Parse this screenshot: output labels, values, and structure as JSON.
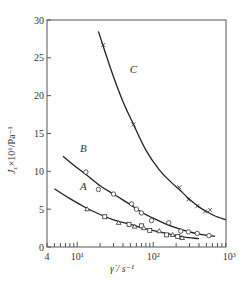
{
  "chart_data": {
    "type": "line",
    "title": "",
    "xlabel": "γ̇ / s⁻¹",
    "ylabel": "Jc × 10⁶ / Pa⁻¹",
    "xscale": "log",
    "xlim": [
      4,
      1000
    ],
    "ylim": [
      0,
      30
    ],
    "x_ticks": [
      {
        "value": 4,
        "label": "4"
      },
      {
        "value": 10,
        "label": "10¹"
      },
      {
        "value": 100,
        "label": "10²"
      },
      {
        "value": 1000,
        "label": "10³"
      }
    ],
    "y_ticks": [
      0,
      5,
      10,
      15,
      20,
      25,
      30
    ],
    "grid": false,
    "legend": null,
    "series": [
      {
        "name": "C",
        "marker": "x",
        "curve": [
          [
            19,
            28.5
          ],
          [
            22,
            26.5
          ],
          [
            30,
            22.5
          ],
          [
            40,
            19.2
          ],
          [
            55,
            16.2
          ],
          [
            80,
            12.8
          ],
          [
            120,
            10.2
          ],
          [
            170,
            8.6
          ],
          [
            220,
            7.6
          ],
          [
            300,
            6.3
          ],
          [
            400,
            5.3
          ],
          [
            500,
            4.7
          ],
          [
            650,
            4.1
          ],
          [
            900,
            3.6
          ]
        ],
        "points": [
          [
            22,
            26.7
          ],
          [
            55,
            16.2
          ],
          [
            220,
            7.9
          ],
          [
            290,
            6.3
          ],
          [
            380,
            5.4
          ],
          [
            480,
            4.7
          ],
          [
            560,
            4.9
          ]
        ]
      },
      {
        "name": "B",
        "marker": "o",
        "curve": [
          [
            6.5,
            12.0
          ],
          [
            9,
            10.8
          ],
          [
            13,
            9.6
          ],
          [
            20,
            8.1
          ],
          [
            30,
            7.0
          ],
          [
            50,
            5.6
          ],
          [
            70,
            4.6
          ],
          [
            100,
            3.8
          ],
          [
            150,
            3.0
          ],
          [
            220,
            2.4
          ],
          [
            300,
            2.0
          ],
          [
            400,
            1.7
          ],
          [
            550,
            1.5
          ],
          [
            650,
            1.4
          ]
        ],
        "points": [
          [
            13,
            9.9
          ],
          [
            19,
            7.6
          ],
          [
            30,
            7.0
          ],
          [
            52,
            5.7
          ],
          [
            60,
            5.0
          ],
          [
            70,
            4.5
          ],
          [
            95,
            3.5
          ],
          [
            160,
            3.2
          ],
          [
            230,
            2.1
          ],
          [
            290,
            2.0
          ],
          [
            380,
            1.8
          ],
          [
            540,
            1.5
          ]
        ]
      },
      {
        "name": "A",
        "marker": "triangle/square",
        "curve": [
          [
            5,
            7.7
          ],
          [
            8,
            6.4
          ],
          [
            13,
            5.2
          ],
          [
            20,
            4.3
          ],
          [
            30,
            3.6
          ],
          [
            50,
            3.0
          ],
          [
            80,
            2.4
          ],
          [
            120,
            2.0
          ],
          [
            180,
            1.6
          ],
          [
            260,
            1.3
          ],
          [
            400,
            1.1
          ]
        ],
        "points": [
          [
            13.5,
            5.0
          ],
          [
            23,
            4.0
          ],
          [
            35,
            3.2
          ],
          [
            48,
            3.0
          ],
          [
            57,
            2.7
          ],
          [
            70,
            2.8
          ],
          [
            75,
            2.5
          ],
          [
            90,
            2.2
          ],
          [
            120,
            2.1
          ],
          [
            150,
            1.6
          ],
          [
            180,
            1.6
          ],
          [
            210,
            1.4
          ],
          [
            240,
            1.2
          ]
        ]
      }
    ],
    "annotations": [
      {
        "text": "C",
        "x": 55,
        "y": 23
      },
      {
        "text": "B",
        "x": 12,
        "y": 12.5
      },
      {
        "text": "A",
        "x": 12,
        "y": 7.5
      }
    ]
  },
  "axes": {
    "y_label_main": "J",
    "y_label_sub": "c",
    "y_label_rest": "×10⁶/Pa⁻¹",
    "x_label": "γ̇ / s⁻¹"
  }
}
